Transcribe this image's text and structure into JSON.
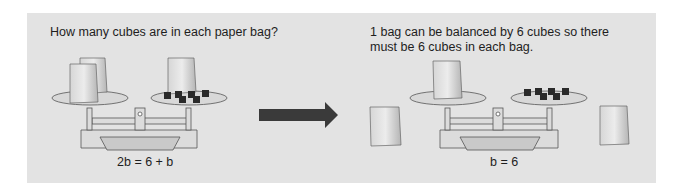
{
  "left_panel": {
    "question": "How many cubes are in each paper bag?",
    "equation": "2b = 6 + b",
    "scale": {
      "left_pan": {
        "bags": 2,
        "cubes": 0
      },
      "right_pan": {
        "bags": 1,
        "cubes": 6
      }
    }
  },
  "arrow": {
    "icon": "right-arrow-icon",
    "color": "#3a3a3a"
  },
  "right_panel": {
    "explanation": "1 bag can be balanced by 6 cubes so there must be 6 cubes in each bag.",
    "equation": "b = 6",
    "scale": {
      "left_pan": {
        "bags": 1,
        "cubes": 0
      },
      "right_pan": {
        "bags": 0,
        "cubes": 6
      }
    },
    "removed_bags": 2
  },
  "colors": {
    "panel_bg": "#e3e3e3",
    "text": "#1e1e1e",
    "bag": "#c9c9c9",
    "cube": "#2a2a2a"
  }
}
